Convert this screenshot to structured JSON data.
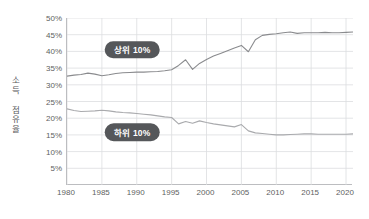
{
  "chart_data": {
    "type": "line",
    "title": "",
    "xlabel": "",
    "ylabel": "소득 점유율",
    "xlim": [
      1980,
      2021
    ],
    "ylim": [
      0,
      50
    ],
    "grid": true,
    "legend_position": "inline-labels",
    "x_ticks": [
      "1980",
      "1985",
      "1990",
      "1995",
      "2000",
      "2005",
      "2010",
      "2015",
      "2020"
    ],
    "x_tick_values": [
      1980,
      1985,
      1990,
      1995,
      2000,
      2005,
      2010,
      2015,
      2020
    ],
    "y_ticks": [
      "5%",
      "10%",
      "15%",
      "20%",
      "25%",
      "30%",
      "35%",
      "40%",
      "45%",
      "50%"
    ],
    "y_tick_values": [
      5,
      10,
      15,
      20,
      25,
      30,
      35,
      40,
      45,
      50
    ],
    "x": [
      1980,
      1981,
      1982,
      1983,
      1984,
      1985,
      1986,
      1987,
      1988,
      1989,
      1990,
      1991,
      1992,
      1993,
      1994,
      1995,
      1996,
      1997,
      1998,
      1999,
      2000,
      2001,
      2002,
      2003,
      2004,
      2005,
      2006,
      2007,
      2008,
      2009,
      2010,
      2011,
      2012,
      2013,
      2014,
      2015,
      2016,
      2017,
      2018,
      2019,
      2020,
      2021
    ],
    "series": [
      {
        "name": "상위 10%",
        "color": "#8a8b8e",
        "label_x": 1989.5,
        "label_y": 40.5,
        "values": [
          32.6,
          32.9,
          33.1,
          33.5,
          33.2,
          32.7,
          33.0,
          33.4,
          33.6,
          33.7,
          33.8,
          33.8,
          33.9,
          34.0,
          34.2,
          34.5,
          35.8,
          37.5,
          34.6,
          36.4,
          37.6,
          38.6,
          39.4,
          40.2,
          41.0,
          41.8,
          39.9,
          43.5,
          44.8,
          45.1,
          45.3,
          45.6,
          45.8,
          45.4,
          45.6,
          45.6,
          45.6,
          45.7,
          45.6,
          45.6,
          45.7,
          45.8
        ]
      },
      {
        "name": "하위 10%",
        "color": "#a9aaad",
        "label_x": 1989.5,
        "label_y": 15.8,
        "values": [
          22.8,
          22.3,
          22.0,
          22.1,
          22.2,
          22.4,
          22.2,
          21.9,
          21.7,
          21.6,
          21.4,
          21.2,
          21.0,
          20.7,
          20.4,
          20.2,
          18.3,
          19.0,
          18.5,
          19.2,
          18.7,
          18.3,
          18.0,
          17.7,
          17.4,
          18.1,
          16.2,
          15.6,
          15.4,
          15.2,
          15.0,
          15.0,
          15.1,
          15.2,
          15.3,
          15.3,
          15.2,
          15.2,
          15.2,
          15.2,
          15.2,
          15.3
        ]
      }
    ]
  },
  "axis": {
    "y_title": "소득 점유율"
  }
}
